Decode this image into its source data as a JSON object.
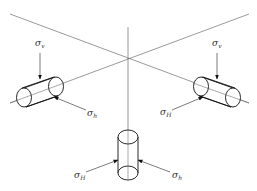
{
  "diagram": {
    "labels": {
      "left_top": {
        "symbol": "σ",
        "sub": "v"
      },
      "left_bottom": {
        "symbol": "σ",
        "sub": "h"
      },
      "right_top": {
        "symbol": "σ",
        "sub": "v"
      },
      "right_bottom": {
        "symbol": "σ",
        "sub": "H"
      },
      "bottom_left": {
        "symbol": "σ",
        "sub": "H"
      },
      "bottom_right": {
        "symbol": "σ",
        "sub": "h"
      }
    },
    "colors": {
      "axis": "#555555",
      "outline": "#111111",
      "text": "#333333"
    }
  }
}
